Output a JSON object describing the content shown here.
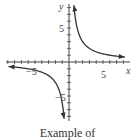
{
  "chart_data": {
    "type": "line",
    "title": "",
    "xlabel": "x",
    "ylabel": "y",
    "xlim": [
      -9.5,
      9
    ],
    "ylim": [
      -9,
      9
    ],
    "x_ticks_labeled": [
      -5,
      5
    ],
    "y_ticks_labeled": [
      5,
      -5
    ],
    "grid": false,
    "series": [
      {
        "name": "y = 6/x (x > 0)",
        "x": [
          0.7,
          1,
          2,
          3,
          4,
          5,
          6,
          7,
          8
        ],
        "y": [
          8.6,
          6,
          3,
          2,
          1.5,
          1.2,
          1,
          0.86,
          0.75
        ]
      },
      {
        "name": "y = 6/x (x < 0)",
        "x": [
          -9,
          -8,
          -7,
          -6,
          -5,
          -4,
          -3,
          -2,
          -1,
          -0.7
        ],
        "y": [
          -0.67,
          -0.75,
          -0.86,
          -1,
          -1.2,
          -1.5,
          -2,
          -3,
          -6,
          -8.6
        ]
      }
    ]
  },
  "labels": {
    "x_axis": "x",
    "y_axis": "y",
    "x_neg": "−5",
    "x_pos": "5",
    "y_pos": "5",
    "y_neg": "−5"
  },
  "caption": "Example of"
}
